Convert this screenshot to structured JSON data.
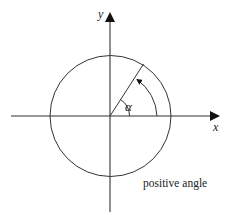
{
  "diagram": {
    "type": "unit-circle-angle",
    "x_axis_label": "x",
    "y_axis_label": "y",
    "angle_label": "α",
    "caption": "positive angle",
    "angle_degrees": 57,
    "direction": "counterclockwise",
    "colors": {
      "stroke": "#333333",
      "background": "#ffffff"
    }
  }
}
